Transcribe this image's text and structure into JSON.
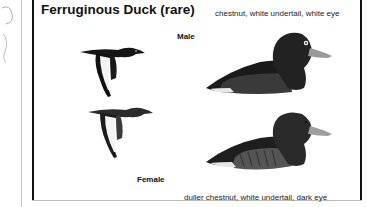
{
  "plate": {
    "title": "Ferruginous Duck (rare)",
    "male": {
      "label": "Male",
      "description": "chestnut, white undertail, white eye"
    },
    "female": {
      "label": "Female",
      "description": "duller chestnut, white undertail, dark eye"
    }
  },
  "colors": {
    "ink": "#111111",
    "male_body": "#2a2a2a",
    "female_body": "#3c3c3c",
    "bill": "#9a9a9a",
    "background": "#ffffff"
  }
}
